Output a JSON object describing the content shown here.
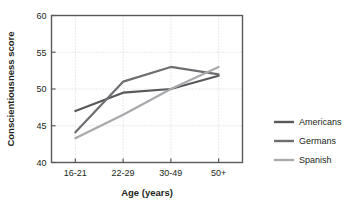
{
  "chart_data": {
    "type": "line",
    "title": "",
    "subtitle": "",
    "xlabel": "Age (years)",
    "ylabel": "Conscientiousness score",
    "categories": [
      "16-21",
      "22-29",
      "30-49",
      "50+"
    ],
    "ylim": [
      40,
      60
    ],
    "yticks": [
      40,
      45,
      50,
      55,
      60
    ],
    "ytick_labels": [
      "40",
      "45",
      "50",
      "55",
      "60"
    ],
    "grid": true,
    "grid_style": "dotted",
    "legend_position": "right",
    "series": [
      {
        "name": "Americans",
        "color": "#58595b",
        "values": [
          47.0,
          49.5,
          50.0,
          51.8
        ]
      },
      {
        "name": "Germans",
        "color": "#6d6e71",
        "values": [
          44.1,
          51.0,
          53.0,
          52.0
        ]
      },
      {
        "name": "Spanish",
        "color": "#a7a9ac",
        "values": [
          43.3,
          46.5,
          50.0,
          53.0
        ]
      }
    ]
  },
  "legend": {
    "items": [
      {
        "label": "Americans",
        "color": "#58595b"
      },
      {
        "label": "Germans",
        "color": "#6d6e71"
      },
      {
        "label": "Spanish",
        "color": "#a7a9ac"
      }
    ]
  },
  "style": {
    "frame_color": "#58595b",
    "grid_color": "#c9c9c9",
    "text_color": "#231f20",
    "background": "#ffffff"
  }
}
